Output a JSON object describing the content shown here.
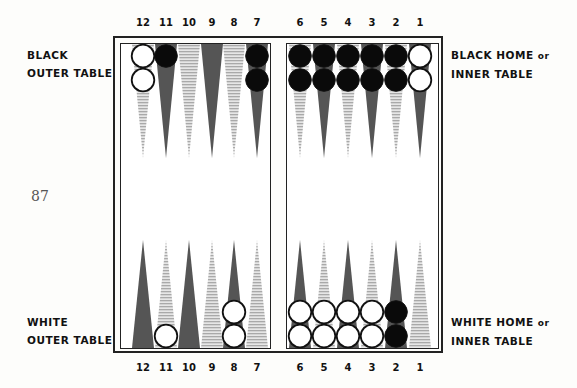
{
  "page_number": "87",
  "labels": {
    "black_outer": [
      "BLACK",
      "OUTER TABLE"
    ],
    "black_home": [
      "BLACK HOME",
      "or",
      "INNER TABLE"
    ],
    "white_outer": [
      "WHITE",
      "OUTER TABLE"
    ],
    "white_home": [
      "WHITE HOME",
      "or",
      "INNER TABLE"
    ]
  },
  "point_numbers_top": [
    "12",
    "11",
    "10",
    "9",
    "8",
    "7",
    "6",
    "5",
    "4",
    "3",
    "2",
    "1"
  ],
  "point_numbers_bottom": [
    "12",
    "11",
    "10",
    "9",
    "8",
    "7",
    "6",
    "5",
    "4",
    "3",
    "2",
    "1"
  ],
  "colors": {
    "dark_point": "#555555",
    "light_point": "#bdbdbd",
    "black_checker": "#0a0a0a",
    "white_checker": "#ffffff"
  },
  "board": {
    "top": [
      {
        "point": "12",
        "shade": "light",
        "checkers": [
          "white",
          "white"
        ]
      },
      {
        "point": "11",
        "shade": "dark",
        "checkers": [
          "black"
        ]
      },
      {
        "point": "10",
        "shade": "light",
        "checkers": []
      },
      {
        "point": "9",
        "shade": "dark",
        "checkers": []
      },
      {
        "point": "8",
        "shade": "light",
        "checkers": []
      },
      {
        "point": "7",
        "shade": "dark",
        "checkers": [
          "black",
          "black"
        ]
      },
      {
        "point": "6",
        "shade": "light",
        "checkers": [
          "black",
          "black"
        ]
      },
      {
        "point": "5",
        "shade": "dark",
        "checkers": [
          "black",
          "black"
        ]
      },
      {
        "point": "4",
        "shade": "light",
        "checkers": [
          "black",
          "black"
        ]
      },
      {
        "point": "3",
        "shade": "dark",
        "checkers": [
          "black",
          "black"
        ]
      },
      {
        "point": "2",
        "shade": "light",
        "checkers": [
          "black",
          "black"
        ]
      },
      {
        "point": "1",
        "shade": "dark",
        "checkers": [
          "white",
          "white"
        ]
      }
    ],
    "bottom": [
      {
        "point": "12",
        "shade": "dark",
        "checkers": []
      },
      {
        "point": "11",
        "shade": "light",
        "checkers": [
          "white"
        ]
      },
      {
        "point": "10",
        "shade": "dark",
        "checkers": []
      },
      {
        "point": "9",
        "shade": "light",
        "checkers": []
      },
      {
        "point": "8",
        "shade": "dark",
        "checkers": [
          "white",
          "white"
        ]
      },
      {
        "point": "7",
        "shade": "light",
        "checkers": []
      },
      {
        "point": "6",
        "shade": "dark",
        "checkers": [
          "white",
          "white"
        ]
      },
      {
        "point": "5",
        "shade": "light",
        "checkers": [
          "white",
          "white"
        ]
      },
      {
        "point": "4",
        "shade": "dark",
        "checkers": [
          "white",
          "white"
        ]
      },
      {
        "point": "3",
        "shade": "light",
        "checkers": [
          "white",
          "white"
        ]
      },
      {
        "point": "2",
        "shade": "dark",
        "checkers": [
          "black",
          "black"
        ]
      },
      {
        "point": "1",
        "shade": "light",
        "checkers": []
      }
    ]
  }
}
